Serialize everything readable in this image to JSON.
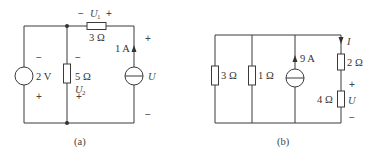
{
  "figures": [
    {
      "id": "a",
      "caption": "(a)",
      "components": {
        "voltage_source": {
          "label": "2 V",
          "polarity_top": "−",
          "polarity_bottom": "+"
        },
        "resistor_5": {
          "label": "5 Ω",
          "voltage_label": "U",
          "voltage_sub": "2",
          "polarity_top": "−",
          "polarity_bottom": "+"
        },
        "resistor_3": {
          "label": "3 Ω",
          "voltage_label": "U",
          "voltage_sub": "1",
          "polarity_left": "−",
          "polarity_right": "+"
        },
        "current_source": {
          "current_label": "1 A",
          "voltage_label": "U",
          "polarity_top": "+",
          "polarity_bottom": "−"
        }
      }
    },
    {
      "id": "b",
      "caption": "(b)",
      "components": {
        "resistor_3": {
          "label": "3 Ω"
        },
        "resistor_1": {
          "label": "1 Ω"
        },
        "current_source": {
          "current_label": "9 A"
        },
        "resistor_2": {
          "label": "2 Ω",
          "current_label": "I"
        },
        "resistor_4": {
          "label": "4 Ω",
          "voltage_label": "U",
          "polarity_top": "+",
          "polarity_bottom": "−"
        }
      }
    }
  ]
}
